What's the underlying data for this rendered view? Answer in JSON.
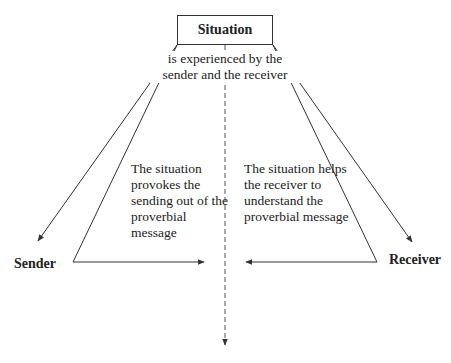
{
  "diagram": {
    "top_node": "Situation",
    "center_caption": "is experienced by the sender and the receiver",
    "left_caption": "The situation provokes the sending out of the proverbial message",
    "right_caption": "The situation helps the receiver to understand the proverbial message",
    "left_node": "Sender",
    "right_node": "Receiver",
    "line_color": "#333333"
  }
}
